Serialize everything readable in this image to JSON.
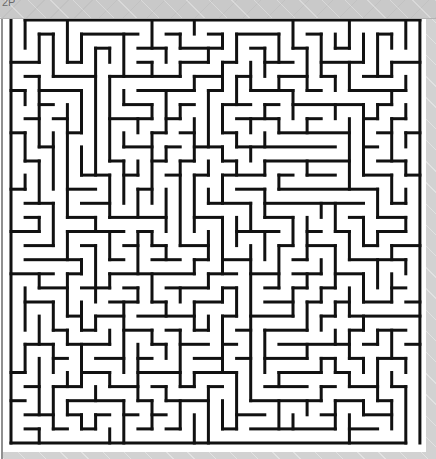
{
  "window": {
    "title_fragment": "2P",
    "chrome_color": "#c9c9c9",
    "canvas_color": "#ffffff",
    "border_color": "#8f8f8f"
  },
  "maze": {
    "name": "maze-puzzle",
    "type": "perfect-maze",
    "cols": 29,
    "rows": 30,
    "cell_size": 14.1,
    "wall_thickness": 3,
    "wall_color": "#111111",
    "background_color": "#ffffff",
    "origin_x": 8,
    "origin_y": 1,
    "entrance": {
      "side": "top",
      "col": 0,
      "label": "start"
    },
    "exit": {
      "side": "bottom",
      "col": 28,
      "label": "finish"
    },
    "seed": 20250731
  }
}
